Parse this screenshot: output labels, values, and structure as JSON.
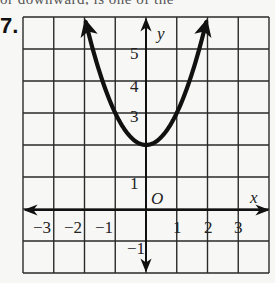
{
  "page": {
    "top_text_fragment": "or downward, is one of the",
    "problem_number": "7."
  },
  "chart_data": {
    "type": "line",
    "title": "",
    "function": "y = x^2 + 2",
    "xlabel": "x",
    "ylabel": "y",
    "origin_label": "O",
    "xlim": [
      -4,
      4
    ],
    "ylim": [
      -2,
      6
    ],
    "grid": true,
    "x_tick_labels": [
      "−3",
      "−2",
      "−1",
      "1",
      "2",
      "3"
    ],
    "x_tick_values": [
      -3,
      -2,
      -1,
      1,
      2,
      3
    ],
    "y_tick_labels": [
      "5",
      "4",
      "3",
      "1",
      "−1"
    ],
    "y_tick_values": [
      5,
      4,
      3,
      1,
      -1
    ],
    "vertex": [
      0,
      2
    ],
    "series": [
      {
        "name": "parabola",
        "x": [
          -2,
          -1.5,
          -1,
          -0.5,
          0,
          0.5,
          1,
          1.5,
          2
        ],
        "y": [
          6,
          4.25,
          3,
          2.25,
          2,
          2.25,
          3,
          4.25,
          6
        ],
        "arrows_at_ends": true
      }
    ]
  }
}
